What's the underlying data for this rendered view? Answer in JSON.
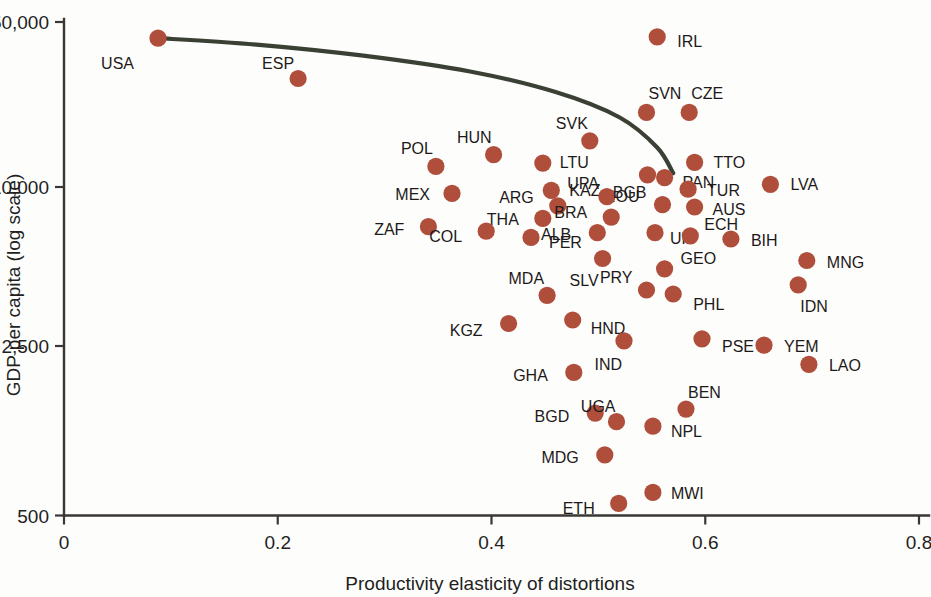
{
  "chart_data": {
    "type": "scatter",
    "title": "",
    "xlabel": "Productivity elasticity of distortions",
    "ylabel": "GDP per capita (log scale)",
    "xlim": [
      0,
      0.8
    ],
    "ylim": [
      500,
      50000
    ],
    "yscale": "log",
    "grid": false,
    "legend": "none",
    "xticks": [
      "0",
      "0.2",
      "0.4",
      "0.6",
      "0.8"
    ],
    "xtick_values": [
      0,
      0.2,
      0.4,
      0.6,
      0.8
    ],
    "yticks": [
      "500",
      "2,500",
      "10,000",
      "50,000"
    ],
    "ytick_values": [
      500,
      2500,
      10000,
      50000
    ],
    "marker_color": "#b04e3c",
    "curve_color": "#3b4034",
    "axis_color": "#3a3736",
    "points": [
      {
        "label": "USA",
        "x": 0.088,
        "y": 43000,
        "lx": -24,
        "ly": 26
      },
      {
        "label": "ESP",
        "x": 0.219,
        "y": 29500,
        "lx": -4,
        "ly": -15
      },
      {
        "label": "IRL",
        "x": 0.555,
        "y": 43500,
        "lx": 20,
        "ly": 5
      },
      {
        "label": "SVN",
        "x": 0.545,
        "y": 21500,
        "lx": 2,
        "ly": -18
      },
      {
        "label": "CZE",
        "x": 0.585,
        "y": 21500,
        "lx": 2,
        "ly": -18
      },
      {
        "label": "SVK",
        "x": 0.492,
        "y": 16500,
        "lx": -2,
        "ly": -17
      },
      {
        "label": "POL",
        "x": 0.348,
        "y": 13000,
        "lx": -3,
        "ly": -17
      },
      {
        "label": "HUN",
        "x": 0.402,
        "y": 14500,
        "lx": -2,
        "ly": -17
      },
      {
        "label": "LTU",
        "x": 0.448,
        "y": 13400,
        "lx": 17,
        "ly": 0
      },
      {
        "label": "TTO",
        "x": 0.59,
        "y": 13500,
        "lx": 19,
        "ly": 1
      },
      {
        "label": "PAN",
        "x": 0.562,
        "y": 11700,
        "lx": 18,
        "ly": 5
      },
      {
        "label": "ROU",
        "x": 0.546,
        "y": 12000,
        "lx": -8,
        "ly": 22
      },
      {
        "label": "TUR",
        "x": 0.584,
        "y": 10500,
        "lx": 19,
        "ly": 2
      },
      {
        "label": "LVA",
        "x": 0.661,
        "y": 11000,
        "lx": 20,
        "ly": 1
      },
      {
        "label": "MEX",
        "x": 0.363,
        "y": 10100,
        "lx": -22,
        "ly": 2
      },
      {
        "label": "KAZ",
        "x": 0.456,
        "y": 10400,
        "lx": 18,
        "ly": 1
      },
      {
        "label": "UPA",
        "x": 0.508,
        "y": 9800,
        "lx": -8,
        "ly": -13
      },
      {
        "label": "ARG",
        "x": 0.462,
        "y": 9000,
        "lx": -24,
        "ly": -8
      },
      {
        "label": "BGB",
        "x": 0.56,
        "y": 9100,
        "lx": -16,
        "ly": -12
      },
      {
        "label": "AUS",
        "x": 0.59,
        "y": 8900,
        "lx": 18,
        "ly": 3
      },
      {
        "label": "BRA",
        "x": 0.512,
        "y": 8100,
        "lx": -24,
        "ly": -4
      },
      {
        "label": "THA",
        "x": 0.448,
        "y": 8000,
        "lx": -24,
        "ly": 2
      },
      {
        "label": "ZAF",
        "x": 0.341,
        "y": 7400,
        "lx": -24,
        "ly": 3
      },
      {
        "label": "COL",
        "x": 0.395,
        "y": 7100,
        "lx": -24,
        "ly": 6
      },
      {
        "label": "PER",
        "x": 0.437,
        "y": 6700,
        "lx": 18,
        "ly": 6
      },
      {
        "label": "ALB",
        "x": 0.499,
        "y": 7000,
        "lx": -26,
        "ly": 2
      },
      {
        "label": "UK",
        "x": 0.553,
        "y": 7000,
        "lx": 15,
        "ly": 6
      },
      {
        "label": "ECH",
        "x": 0.586,
        "y": 6800,
        "lx": 14,
        "ly": -11
      },
      {
        "label": "BIH",
        "x": 0.624,
        "y": 6600,
        "lx": 20,
        "ly": 2
      },
      {
        "label": "MNG",
        "x": 0.695,
        "y": 5400,
        "lx": 20,
        "ly": 2
      },
      {
        "label": "SLV",
        "x": 0.504,
        "y": 5500,
        "lx": -4,
        "ly": 22
      },
      {
        "label": "GEO",
        "x": 0.562,
        "y": 5000,
        "lx": 16,
        "ly": -10
      },
      {
        "label": "PRY",
        "x": 0.545,
        "y": 4100,
        "lx": -14,
        "ly": -12
      },
      {
        "label": "PHL",
        "x": 0.57,
        "y": 3950,
        "lx": 20,
        "ly": 11
      },
      {
        "label": "IDN",
        "x": 0.687,
        "y": 4300,
        "lx": 2,
        "ly": 22
      },
      {
        "label": "MDA",
        "x": 0.452,
        "y": 3900,
        "lx": -3,
        "ly": -16
      },
      {
        "label": "KGZ",
        "x": 0.416,
        "y": 3000,
        "lx": -26,
        "ly": 7
      },
      {
        "label": "HND",
        "x": 0.476,
        "y": 3100,
        "lx": 18,
        "ly": 9
      },
      {
        "label": "IND",
        "x": 0.524,
        "y": 2550,
        "lx": -2,
        "ly": 24
      },
      {
        "label": "PSE",
        "x": 0.597,
        "y": 2600,
        "lx": 20,
        "ly": 8
      },
      {
        "label": "YEM",
        "x": 0.655,
        "y": 2450,
        "lx": 20,
        "ly": 2
      },
      {
        "label": "LAO",
        "x": 0.697,
        "y": 2050,
        "lx": 20,
        "ly": 2
      },
      {
        "label": "GHA",
        "x": 0.477,
        "y": 1900,
        "lx": -26,
        "ly": 4
      },
      {
        "label": "BEN",
        "x": 0.582,
        "y": 1350,
        "lx": 2,
        "ly": -16
      },
      {
        "label": "BGD",
        "x": 0.497,
        "y": 1300,
        "lx": -26,
        "ly": 4
      },
      {
        "label": "UGA",
        "x": 0.517,
        "y": 1200,
        "lx": -1,
        "ly": -15
      },
      {
        "label": "NPL",
        "x": 0.551,
        "y": 1150,
        "lx": 18,
        "ly": 6
      },
      {
        "label": "MDG",
        "x": 0.506,
        "y": 880,
        "lx": -26,
        "ly": 3
      },
      {
        "label": "MWI",
        "x": 0.551,
        "y": 620,
        "lx": 18,
        "ly": 2
      },
      {
        "label": "ETH",
        "x": 0.519,
        "y": 560,
        "lx": -24,
        "ly": 6
      }
    ],
    "fit_curve": {
      "description": "downward sloping fitted trend line",
      "points": [
        {
          "x": 0.089,
          "y": 43000
        },
        {
          "x": 0.18,
          "y": 40500
        },
        {
          "x": 0.28,
          "y": 36500
        },
        {
          "x": 0.38,
          "y": 31500
        },
        {
          "x": 0.46,
          "y": 26000
        },
        {
          "x": 0.52,
          "y": 20500
        },
        {
          "x": 0.555,
          "y": 15500
        },
        {
          "x": 0.57,
          "y": 12200
        }
      ]
    }
  }
}
